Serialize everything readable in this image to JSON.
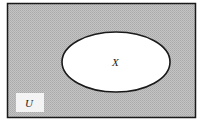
{
  "diagram": {
    "type": "venn",
    "universe_label": "U",
    "set_label": "X",
    "shaded_region": "complement of X in U",
    "colors": {
      "shade": "#bdbdbd",
      "shade_dot": "#a8a8a8",
      "set_fill": "#ffffff",
      "stroke": "#1a1a1a",
      "label_box": "#f4f4f4"
    }
  }
}
